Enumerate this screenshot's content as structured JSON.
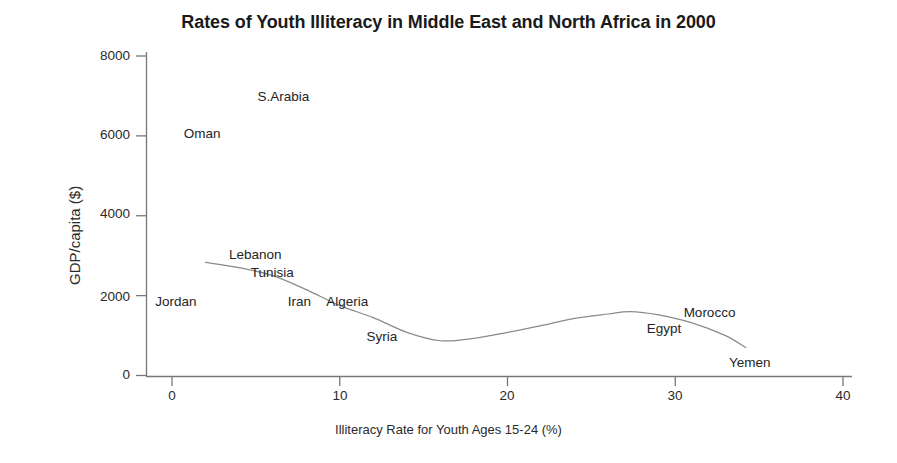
{
  "chart_data": {
    "type": "line",
    "title": "Rates of Youth Illiteracy in Middle East and North Africa in 2000",
    "xlabel": "Illiteracy Rate for Youth Ages 15-24 (%)",
    "ylabel": "GDP/capita ($)",
    "xlim": [
      0,
      40
    ],
    "ylim": [
      0,
      8000
    ],
    "xticks": [
      "0",
      "10",
      "20",
      "30",
      "40"
    ],
    "xtick_values": [
      0,
      10,
      20,
      30,
      40
    ],
    "yticks": [
      "0",
      "2000",
      "4000",
      "6000",
      "8000"
    ],
    "ytick_values": [
      0,
      2000,
      4000,
      6000,
      8000
    ],
    "grid": false,
    "legend": "none",
    "line_color": "#8a8a8a",
    "series": [
      {
        "name": "GDP/capita vs youth illiteracy",
        "x": [
          2.0,
          4.0,
          6.0,
          8.0,
          10.0,
          12.0,
          14.0,
          16.0,
          18.0,
          20.0,
          22.0,
          24.0,
          26.0,
          27.3,
          29.0,
          31.0,
          33.0,
          34.2
        ],
        "y": [
          2830,
          2700,
          2500,
          2150,
          1750,
          1450,
          1080,
          870,
          930,
          1080,
          1250,
          1430,
          1540,
          1600,
          1520,
          1320,
          1000,
          700
        ]
      }
    ],
    "annotations": [
      {
        "label": "Oman",
        "x": 0.7,
        "y": 6020
      },
      {
        "label": "S.Arabia",
        "x": 5.1,
        "y": 6950
      },
      {
        "label": "Jordan",
        "x": -1.0,
        "y": 1815
      },
      {
        "label": "Lebanon",
        "x": 3.4,
        "y": 2985
      },
      {
        "label": "Tunisia",
        "x": 4.7,
        "y": 2540
      },
      {
        "label": "Iran",
        "x": 6.9,
        "y": 1815
      },
      {
        "label": "Algeria",
        "x": 9.2,
        "y": 1815
      },
      {
        "label": "Syria",
        "x": 11.6,
        "y": 930
      },
      {
        "label": "Egypt",
        "x": 28.3,
        "y": 1140
      },
      {
        "label": "Morocco",
        "x": 30.5,
        "y": 1530
      },
      {
        "label": "Yemen",
        "x": 33.2,
        "y": 300
      }
    ]
  }
}
